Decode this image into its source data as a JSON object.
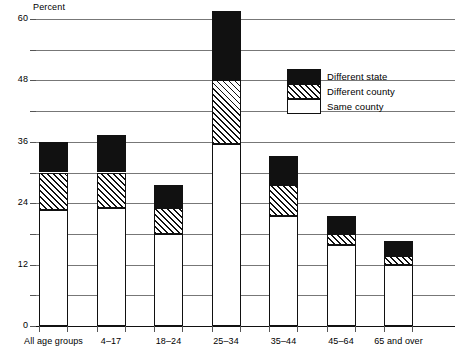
{
  "chart_data": {
    "type": "bar",
    "subtype": "stacked-bar",
    "title": "",
    "xlabel": "",
    "ylabel": "Percent",
    "ylim": [
      0,
      60
    ],
    "yticks": [
      0,
      12,
      24,
      36,
      48,
      60
    ],
    "ytick_labels": [
      "0",
      "12",
      "24",
      "36",
      "48",
      "60"
    ],
    "minor_gridlines": [
      6,
      18,
      30,
      42,
      54
    ],
    "grid": true,
    "legend_position": "inside-upper-right",
    "categories": [
      "All age groups",
      "4–17",
      "18–24",
      "25–34",
      "35–44",
      "45–64",
      "65 and over"
    ],
    "series": [
      {
        "name": "Same county",
        "fill": "white",
        "values": [
          22.6,
          23.0,
          18.0,
          35.5,
          21.5,
          15.8,
          12.0
        ]
      },
      {
        "name": "Different county",
        "fill": "hatched",
        "values": [
          7.4,
          7.0,
          5.0,
          12.5,
          6.0,
          2.2,
          1.7
        ]
      },
      {
        "name": "Different state",
        "fill": "black",
        "values": [
          6.0,
          7.3,
          4.5,
          13.5,
          5.8,
          3.5,
          3.0
        ]
      }
    ],
    "totals": [
      36.0,
      37.3,
      27.5,
      61.5,
      33.3,
      21.5,
      16.7
    ]
  },
  "legend": {
    "items": [
      {
        "label": "Different state",
        "swatch": "black"
      },
      {
        "label": "Different county",
        "swatch": "hatched"
      },
      {
        "label": "Same county",
        "swatch": "white"
      }
    ]
  },
  "colors": {
    "different_state": "#111111",
    "different_county_line": "#111111",
    "same_county": "#ffffff",
    "grid": "#777777",
    "axis": "#111111"
  }
}
